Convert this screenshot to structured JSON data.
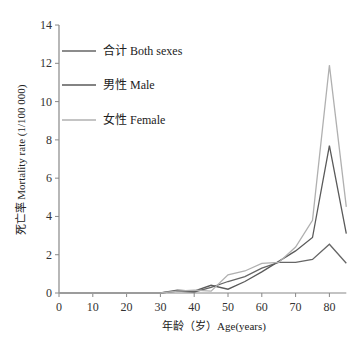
{
  "chart_data": {
    "type": "line",
    "title": "",
    "xlabel": "年龄（岁）Age(years)",
    "ylabel": "死亡率 Mortality rate (1/100 000)",
    "xlim": [
      0,
      85
    ],
    "ylim": [
      0,
      14
    ],
    "xticks": [
      0,
      10,
      20,
      30,
      40,
      50,
      60,
      70,
      80
    ],
    "yticks": [
      0,
      2,
      4,
      6,
      8,
      10,
      12,
      14
    ],
    "grid": false,
    "legend_position": "upper-left",
    "x": [
      30,
      35,
      40,
      45,
      50,
      55,
      60,
      65,
      70,
      75,
      80,
      85
    ],
    "series": [
      {
        "name": "合计 Both sexes",
        "color": "#666666",
        "values": [
          0,
          0.1,
          0.05,
          0.3,
          0.6,
          0.85,
          1.3,
          1.6,
          1.6,
          1.75,
          2.55,
          1.55
        ]
      },
      {
        "name": "男性 Male",
        "color": "#5a5a5a",
        "values": [
          0,
          0.15,
          0.1,
          0.4,
          0.2,
          0.6,
          1.1,
          1.65,
          2.2,
          2.9,
          7.7,
          3.1
        ]
      },
      {
        "name": "女性 Female",
        "color": "#b0b0b0",
        "values": [
          0,
          0.1,
          0.15,
          0.1,
          0.95,
          1.15,
          1.55,
          1.6,
          2.4,
          3.8,
          11.9,
          4.5
        ]
      }
    ]
  },
  "legend": {
    "items": [
      {
        "label": "合计 Both sexes",
        "color": "#666666"
      },
      {
        "label": "男性 Male",
        "color": "#5a5a5a"
      },
      {
        "label": "女性 Female",
        "color": "#b0b0b0"
      }
    ]
  },
  "axes": {
    "x_title": "年龄（岁）Age(years)",
    "y_title": "死亡率 Mortality rate (1/100 000)",
    "x_tick_labels": [
      "0",
      "10",
      "20",
      "30",
      "40",
      "50",
      "60",
      "70",
      "80"
    ],
    "y_tick_labels": [
      "0",
      "2",
      "4",
      "6",
      "8",
      "10",
      "12",
      "14"
    ]
  }
}
